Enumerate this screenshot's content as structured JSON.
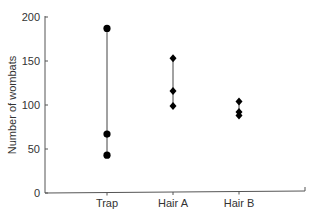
{
  "chart_data": {
    "type": "scatter",
    "title": "",
    "xlabel": "",
    "ylabel": "Number of wombats",
    "ylim": [
      0,
      200
    ],
    "yticks": [
      "0",
      "50",
      "100",
      "150",
      "200"
    ],
    "categories": [
      "Trap",
      "Hair A",
      "Hair B"
    ],
    "series": [
      {
        "name": "Trap",
        "marker": "circle",
        "values": [
          187,
          67,
          43
        ]
      },
      {
        "name": "Hair A",
        "marker": "diamond",
        "values": [
          153,
          116,
          99
        ]
      },
      {
        "name": "Hair B",
        "marker": "diamond",
        "values": [
          104,
          92,
          88
        ]
      }
    ],
    "grid": false,
    "legend": null
  }
}
